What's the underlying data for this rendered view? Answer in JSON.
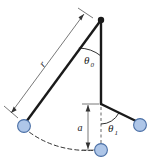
{
  "figure": {
    "type": "physics-diagram",
    "background_color": "#ffffff"
  },
  "labels": {
    "length_label": "r",
    "angle0_label": "θ",
    "angle0_sub": "0",
    "angle1_label": "θ",
    "angle1_sub": "1",
    "offset_label": "a"
  },
  "colors": {
    "bob_fill": "#aec6e8",
    "bob_stroke": "#4a6fa5",
    "rod": "#1a1a1a",
    "dimension": "#555555",
    "dashed": "#333333",
    "text": "#1a1a1a"
  },
  "geometry": {
    "pivot": {
      "x": 101,
      "y": 20,
      "name": "pivot-point"
    },
    "bob_left": {
      "x": 24,
      "y": 126,
      "r": 6.5,
      "name": "left-bob"
    },
    "bob_bottom": {
      "x": 101,
      "y": 150,
      "r": 6.5,
      "name": "bottom-bob"
    },
    "bob_right": {
      "x": 140,
      "y": 125,
      "r": 6.5,
      "name": "right-bob"
    },
    "joint": {
      "x": 101,
      "y": 104,
      "name": "mid-joint"
    },
    "rod_pivot_to_left_bob": {
      "from": "pivot",
      "to": "bob_left"
    },
    "rod_pivot_to_joint": {
      "from": "pivot",
      "to": "joint"
    },
    "rod_joint_to_right_bob": {
      "from": "joint",
      "to": "bob_right"
    },
    "arc_swing": {
      "from": "bob_left",
      "to": "bob_bottom",
      "style": "dashed"
    },
    "dimension_length": {
      "from": {
        "x": 84,
        "y": 14
      },
      "to": {
        "x": 11,
        "y": 113
      }
    },
    "dimension_offset": {
      "from": {
        "x": 88,
        "y": 104
      },
      "to": {
        "x": 88,
        "y": 150
      }
    },
    "vertical_reference": {
      "from": {
        "x": 101,
        "y": 96
      },
      "to": {
        "x": 101,
        "y": 152
      },
      "style": "dashed"
    },
    "angle0_arc": {
      "center": "pivot",
      "radius": 36,
      "from_deg": 90,
      "to_deg": 128
    },
    "angle1_arc": {
      "center": "joint",
      "radius": 20,
      "from_deg": 90,
      "to_deg": 27
    }
  },
  "label_positions": {
    "length": {
      "x": 45,
      "y": 66,
      "rotate": -53
    },
    "angle0": {
      "x": 87,
      "y": 63
    },
    "angle1": {
      "x": 110,
      "y": 130
    },
    "offset": {
      "x": 80,
      "y": 131
    }
  }
}
